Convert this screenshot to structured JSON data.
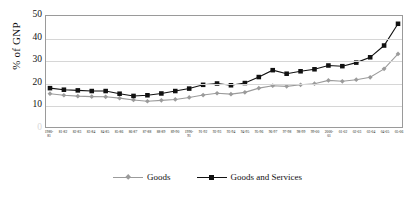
{
  "chart_data": {
    "type": "line",
    "title": "",
    "xlabel": "",
    "ylabel": "% of GNP",
    "ylim": [
      0,
      50
    ],
    "yticks": [
      0,
      10,
      20,
      30,
      40,
      50
    ],
    "grid": true,
    "legend_position": "bottom",
    "categories": [
      "1980-\n81",
      "81-82",
      "82-83",
      "83-84",
      "84-85",
      "85-86",
      "86-87",
      "87-88",
      "88-89",
      "89-90",
      "1990-\n91",
      "91-92",
      "92-93",
      "93-94",
      "94-95",
      "95-96",
      "96-97",
      "97-98",
      "98-99",
      "99-00",
      "2000-\n01",
      "01-02",
      "02-03",
      "03-04",
      "04-05",
      "05-06"
    ],
    "series": [
      {
        "name": "Goods",
        "color": "#9b9b9b",
        "marker": "diamond",
        "values": [
          15.0,
          14.3,
          13.9,
          13.7,
          13.6,
          13.0,
          12.2,
          11.6,
          12.0,
          12.4,
          13.3,
          14.4,
          15.2,
          14.8,
          15.6,
          17.5,
          18.6,
          18.3,
          19.0,
          19.5,
          21.0,
          20.6,
          21.3,
          22.4,
          26.2,
          32.9
        ]
      },
      {
        "name": "Goods and Services",
        "color": "#111111",
        "marker": "square",
        "values": [
          17.5,
          16.8,
          16.5,
          16.2,
          16.2,
          15.0,
          14.0,
          14.3,
          15.1,
          16.2,
          17.3,
          19.0,
          19.6,
          18.8,
          19.8,
          22.5,
          25.6,
          24.0,
          25.1,
          26.0,
          27.7,
          27.4,
          29.0,
          31.4,
          36.7,
          46.5
        ]
      }
    ]
  },
  "legend": {
    "items": [
      {
        "label": "Goods"
      },
      {
        "label": "Goods and Services"
      }
    ]
  }
}
